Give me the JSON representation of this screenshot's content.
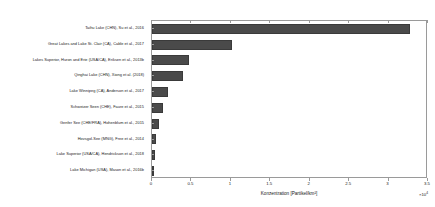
{
  "chart_data": {
    "type": "bar",
    "orientation": "horizontal",
    "title": "",
    "xlabel": "Konzentration [Partikel/km²]",
    "ylabel": "",
    "x_exponent_label": "×10",
    "x_exponent_power": "4",
    "x_scale_multiplier": 10000,
    "xlim": [
      0,
      3.5
    ],
    "xticks": [
      0,
      0.5,
      1,
      1.5,
      2,
      2.5,
      3,
      3.5
    ],
    "xticklabels": [
      "0",
      "0.5",
      "1",
      "1.5",
      "2",
      "2.5",
      "3",
      "3.5"
    ],
    "grid": false,
    "legend": null,
    "bar_color": "#4a4a4a",
    "categories": [
      "Taihu Lake (CHN), Su et al., 2016",
      "Great Lakes and Lake St. Clair (CA), Cable et al., 2017",
      "Lakes Superior, Huron and Erie (USA/CA), Eriksen et al., 2013b",
      "Qinghai Lake (CHN), Xiong et al. (2018)",
      "Lake Winnipeg (CA), Anderson et al., 2017",
      "Schweizer Seen (CHE), Faure et al., 2015",
      "Genfer See (CHE/FRA), Hohenblum et al., 2015",
      "Hovsgol-See (MNG), Free et al., 2014",
      "Lake Superior (USA/CA), Hendrickson et al., 2018",
      "Lake Michigan (USA), Mason et al., 2016b"
    ],
    "values": [
      3.27,
      1.02,
      0.47,
      0.39,
      0.2,
      0.14,
      0.09,
      0.05,
      0.04,
      0.015
    ]
  }
}
